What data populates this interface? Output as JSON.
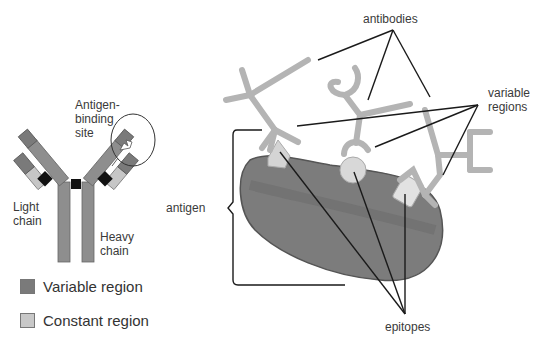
{
  "left_diagram": {
    "labels": {
      "antigen_binding_site_line1": "Antigen-",
      "antigen_binding_site_line2": "binding",
      "antigen_binding_site_line3": "site",
      "light_chain_line1": "Light",
      "light_chain_line2": "chain",
      "heavy_chain_line1": "Heavy",
      "heavy_chain_line2": "chain"
    },
    "legend": [
      {
        "label": "Variable region",
        "color": "#7a7a7a"
      },
      {
        "label": "Constant region",
        "color": "#c8c8c8"
      }
    ],
    "colors": {
      "variable": "#7a7a7a",
      "constant": "#c6c6c6",
      "heavy_constant": "#8e8e8e",
      "disulfide": "#111111"
    }
  },
  "right_diagram": {
    "labels": {
      "antibodies": "antibodies",
      "variable_line1": "variable",
      "variable_line2": "regions",
      "antigen": "antigen",
      "epitopes": "epitopes"
    },
    "colors": {
      "antigen_fill": "#7c7c7c",
      "antibody": "#b4b4b4",
      "epitope": "#d8d8d8",
      "leader_line": "#1a1a1a"
    }
  }
}
